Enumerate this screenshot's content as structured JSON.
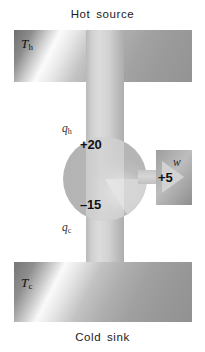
{
  "figure": {
    "title_top": "Hot source",
    "title_bottom": "Cold sink"
  },
  "reservoirs": {
    "hot": {
      "caption": "Hot source",
      "temperature_label": "T",
      "temperature_subscript": "h"
    },
    "cold": {
      "caption": "Cold sink",
      "temperature_label": "T",
      "temperature_subscript": "c"
    }
  },
  "flows": {
    "heat_in": {
      "symbol": "q",
      "subscript": "h",
      "value": "+20"
    },
    "heat_out": {
      "symbol": "q",
      "subscript": "c",
      "value": "–15"
    },
    "work_out": {
      "symbol": "w",
      "value": "+5"
    }
  },
  "colors": {
    "text": "#111111",
    "hot_block": "#b0b0b0",
    "cold_block": "#aeaeae",
    "arrow": "#c9c9c9",
    "engine": "#b6b6b6",
    "work_block": "#a8a8a8"
  }
}
